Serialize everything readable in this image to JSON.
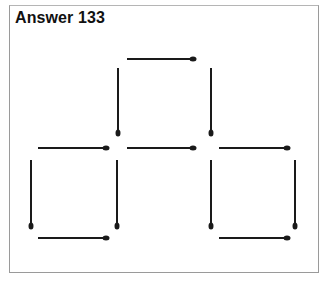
{
  "title": "Answer 133",
  "colors": {
    "stick": "#1a1a1a",
    "border": "#9a9a9a",
    "background": "#ffffff"
  },
  "matchsticks": [
    {
      "id": "top",
      "orientation": "horizontal",
      "x1": 127,
      "y1": 59,
      "x2": 193,
      "y2": 59,
      "head": "end"
    },
    {
      "id": "upper-left-vertical",
      "orientation": "vertical",
      "x1": 118,
      "y1": 68,
      "x2": 118,
      "y2": 133,
      "head": "end"
    },
    {
      "id": "upper-right-vertical",
      "orientation": "vertical",
      "x1": 211,
      "y1": 68,
      "x2": 211,
      "y2": 133,
      "head": "end"
    },
    {
      "id": "middle-left",
      "orientation": "horizontal",
      "x1": 38,
      "y1": 148,
      "x2": 106,
      "y2": 148,
      "head": "end"
    },
    {
      "id": "middle-center",
      "orientation": "horizontal",
      "x1": 127,
      "y1": 148,
      "x2": 193,
      "y2": 148,
      "head": "end"
    },
    {
      "id": "middle-right",
      "orientation": "horizontal",
      "x1": 219,
      "y1": 148,
      "x2": 287,
      "y2": 148,
      "head": "end"
    },
    {
      "id": "lower-far-left-vertical",
      "orientation": "vertical",
      "x1": 31,
      "y1": 160,
      "x2": 31,
      "y2": 226,
      "head": "end"
    },
    {
      "id": "lower-center-left-vertical",
      "orientation": "vertical",
      "x1": 117,
      "y1": 160,
      "x2": 117,
      "y2": 226,
      "head": "end"
    },
    {
      "id": "lower-center-right-vertical",
      "orientation": "vertical",
      "x1": 211,
      "y1": 160,
      "x2": 211,
      "y2": 226,
      "head": "end"
    },
    {
      "id": "lower-far-right-vertical",
      "orientation": "vertical",
      "x1": 295,
      "y1": 160,
      "x2": 295,
      "y2": 226,
      "head": "end"
    },
    {
      "id": "bottom-left",
      "orientation": "horizontal",
      "x1": 38,
      "y1": 238,
      "x2": 106,
      "y2": 238,
      "head": "end"
    },
    {
      "id": "bottom-right",
      "orientation": "horizontal",
      "x1": 219,
      "y1": 238,
      "x2": 287,
      "y2": 238,
      "head": "end"
    }
  ]
}
